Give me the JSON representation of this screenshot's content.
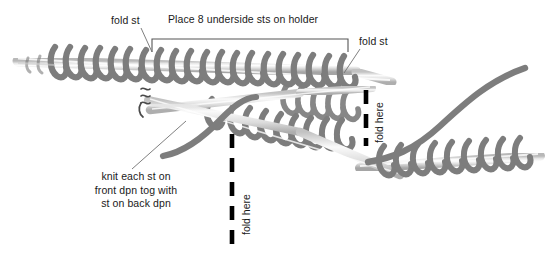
{
  "diagram": {
    "title_note": "Place 8 underside sts on holder",
    "labels": {
      "fold_st_left": "fold st",
      "fold_st_right": "fold st",
      "fold_here_center": "fold here",
      "fold_here_right": "fold here",
      "knit_instruction_line1": "knit each st on",
      "knit_instruction_line2": "front dpn tog with",
      "knit_instruction_line3": "st on back dpn"
    },
    "colors": {
      "background": "#ffffff",
      "yarn": "#7d7d7d",
      "yarn_shadow": "#9a9a9a",
      "needle_light": "#fbfbfb",
      "needle_mid": "#d0d0d0",
      "needle_dark": "#a8a8a8",
      "text": "#1a1a1a",
      "fold_dash": "#000000",
      "bracket": "#555555",
      "leader": "#707070"
    },
    "stitch_count_on_holder": 8
  }
}
